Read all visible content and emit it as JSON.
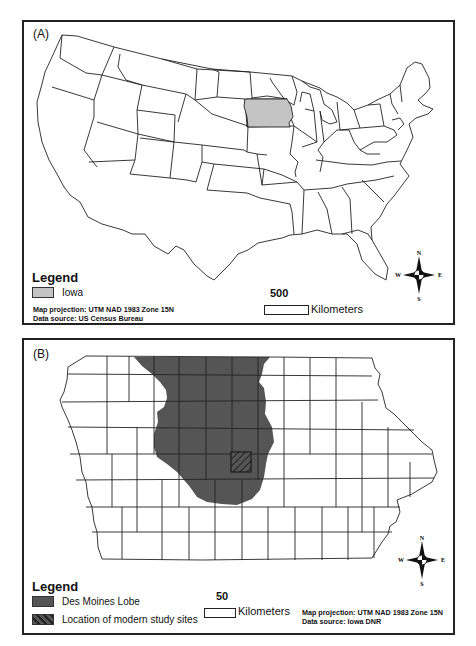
{
  "header": {
    "running_head": "..."
  },
  "panel_a": {
    "label": "(A)",
    "legend": {
      "title": "Legend",
      "items": [
        {
          "label": "Iowa",
          "color": "#c4c4c4"
        }
      ]
    },
    "notes": {
      "projection": "Map projection: UTM NAD 1983 Zone 15N",
      "source": "Data source: US Census Bureau"
    },
    "scale": {
      "value": "500",
      "unit": "Kilometers"
    },
    "compass": {
      "n": "N",
      "s": "S",
      "e": "E",
      "w": "W"
    },
    "highlight_state": "Iowa"
  },
  "panel_b": {
    "label": "(B)",
    "legend": {
      "title": "Legend",
      "items": [
        {
          "label": "Des Moines Lobe",
          "color": "#555555"
        },
        {
          "label": "Location of modern study sites",
          "color": "#555555",
          "pattern": "hatched"
        }
      ]
    },
    "notes": {
      "projection": "Map projection: UTM NAD 1983 Zone 15N",
      "source": "Data source: Iowa DNR"
    },
    "scale": {
      "value": "50",
      "unit": "Kilometers"
    },
    "compass": {
      "n": "N",
      "s": "S",
      "e": "E",
      "w": "W"
    }
  },
  "colors": {
    "iowa_fill": "#c4c4c4",
    "lobe_fill": "#555555",
    "border": "#222222"
  }
}
